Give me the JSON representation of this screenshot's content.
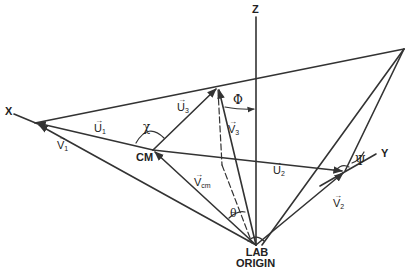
{
  "diagram": {
    "title": "",
    "axes": {
      "z_label": "Z",
      "x_label": "X",
      "y_label": "Y"
    },
    "points": {
      "cm_label": "CM",
      "origin_label_line1": "LAB",
      "origin_label_line2": "ORIGIN"
    },
    "vectors": {
      "u1": {
        "base": "U",
        "sub": "1"
      },
      "u2": {
        "base": "U",
        "sub": "2"
      },
      "u3": {
        "base": "U",
        "sub": "3"
      },
      "v1": {
        "base": "V",
        "sub": "1"
      },
      "v2": {
        "base": "V",
        "sub": "2"
      },
      "v3": {
        "base": "V",
        "sub": "3"
      },
      "vcm": {
        "base": "V",
        "sub": "cm"
      }
    },
    "angles": {
      "chi": "χ",
      "phi": "Φ",
      "theta": "θ",
      "psi": "Ψ"
    },
    "line_color": "#333333"
  }
}
